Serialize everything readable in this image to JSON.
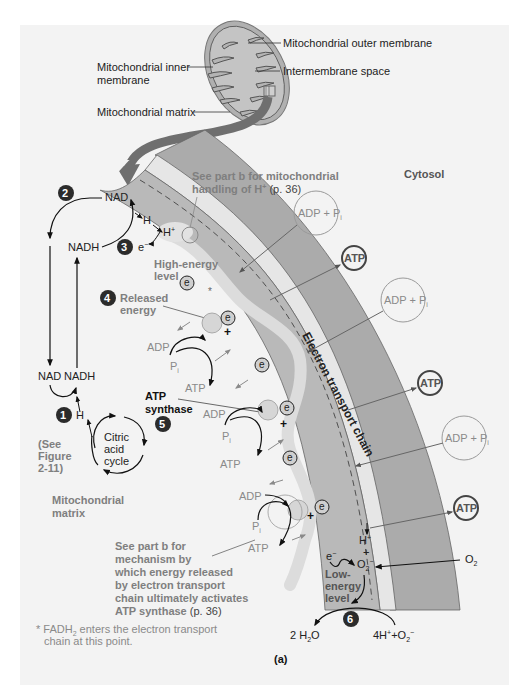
{
  "figure": {
    "panel_label": "(a)",
    "colors": {
      "panel_bg": "#f3f3f3",
      "membrane_dark": "#a9a9a9",
      "membrane_mid": "#b9b9b9",
      "intermembrane_light": "#e6e6e6",
      "energy_path": "#d9d9d9",
      "step_circle": "#2b2b2b",
      "adp_circle": "#9a9a9a",
      "atp_circle": "#444444",
      "arrow_dark": "#111111",
      "arrow_gray": "#8a8a8a"
    }
  },
  "mitochondrion": {
    "outer_membrane": "Mitochondrial outer membrane",
    "inner_membrane_line1": "Mitochondrial inner",
    "inner_membrane_line2": "membrane",
    "intermembrane_space": "Intermembrane space",
    "matrix": "Mitochondrial matrix"
  },
  "regions": {
    "cytosol": "Cytosol",
    "matrix_line1": "Mitochondrial",
    "matrix_line2": "matrix",
    "etc_label": "Electron transport chain"
  },
  "steps": [
    {
      "num": "1"
    },
    {
      "num": "2"
    },
    {
      "num": "3"
    },
    {
      "num": "4"
    },
    {
      "num": "5"
    },
    {
      "num": "6"
    }
  ],
  "nad_cycle": {
    "nad_top": "NAD",
    "nadh_top": "NADH",
    "nad_bottom": "NAD",
    "nadh_bottom": "NADH",
    "h_bottom": "H",
    "h_top": "H",
    "h_plus": "H",
    "h_plus_sup": "+",
    "e_minus": "e",
    "e_minus_sup": "−"
  },
  "citric_acid": {
    "line1": "Citric",
    "line2": "acid",
    "line3": "cycle",
    "see_line1": "(See",
    "see_line2": "Figure",
    "see_line3": "2-11)"
  },
  "annotations": {
    "part_b_hplus_line1": "See part b for mitochondrial",
    "part_b_hplus_line2a": "handling of H",
    "part_b_hplus_sup": "+",
    "part_b_hplus_line2b": " (p. 36)",
    "high_energy_line1": "High-energy",
    "high_energy_line2": "level",
    "released_line1": "Released",
    "released_line2": "energy",
    "atp_synthase_line1": "ATP",
    "atp_synthase_line2": "synthase",
    "mechanism_lines": [
      "See part b for",
      "mechanism by",
      "which energy released",
      "by electron transport",
      "chain ultimately activates"
    ],
    "mechanism_last_bold": "ATP synthase",
    "mechanism_last_plain": " (p. 36)",
    "low_energy_line1": "Low-",
    "low_energy_line2": "energy",
    "low_energy_line3": "level",
    "footnote_star": "*",
    "footnote_line1a": "FADH",
    "footnote_sub": "2",
    "footnote_line1b": " enters the electron transport",
    "footnote_line2": "chain at this point.",
    "star_marker": "*"
  },
  "synthase_sites": [
    {
      "adp": "ADP",
      "pi": "P",
      "pi_sub": "i",
      "atp": "ATP"
    },
    {
      "adp": "ADP",
      "pi": "P",
      "pi_sub": "i",
      "atp": "ATP"
    },
    {
      "adp": "ADP",
      "pi": "P",
      "pi_sub": "i",
      "atp": "ATP"
    }
  ],
  "cytosol_circles": [
    {
      "type": "adp",
      "label": "ADP + P",
      "sub": "i"
    },
    {
      "type": "atp",
      "label": "ATP"
    },
    {
      "type": "adp",
      "label": "ADP + P",
      "sub": "i"
    },
    {
      "type": "atp",
      "label": "ATP"
    },
    {
      "type": "adp",
      "label": "ADP + P",
      "sub": "i"
    },
    {
      "type": "atp",
      "label": "ATP"
    }
  ],
  "electron_markers": {
    "label": "e",
    "sup": "−"
  },
  "oxygen": {
    "o2_outside": "O",
    "o2_outside_sub": "2",
    "h_plus": "H",
    "h_plus_sup": "+",
    "plus": "+",
    "o2_inside": "O",
    "o2_inside_sub": "2",
    "o2_inside_sup": "−",
    "e_minus": "e",
    "e_minus_sup": "−",
    "water": "2 H",
    "water_sub": "2",
    "water_end": "O",
    "reactants_a": "4H",
    "reactants_sup": "+",
    "reactants_b": "+O",
    "reactants_sub": "2",
    "reactants_sup2": "−"
  }
}
